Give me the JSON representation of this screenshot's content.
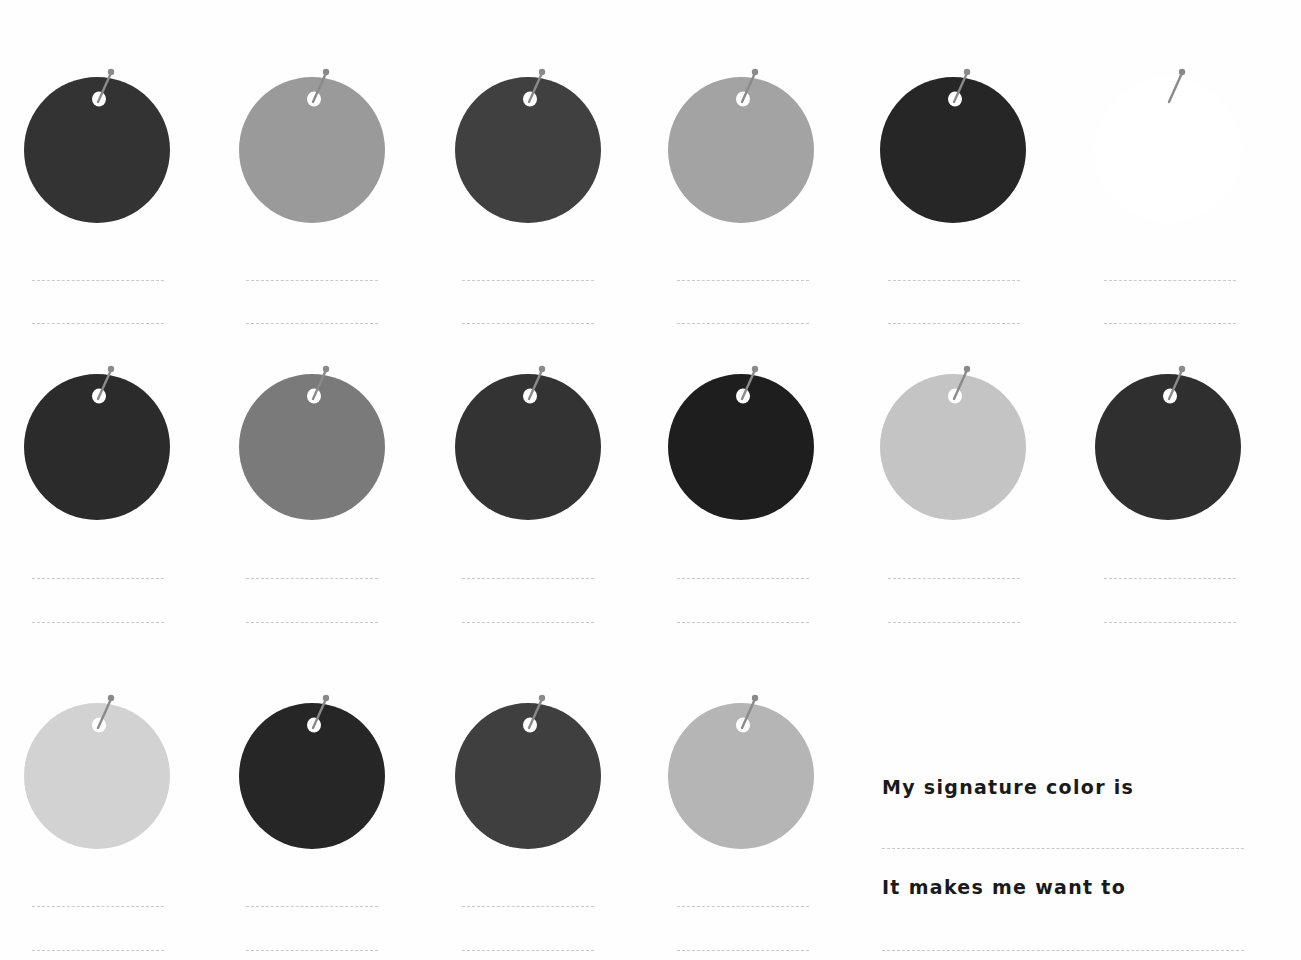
{
  "worksheet": {
    "tags": [
      {
        "row": 1,
        "col": 1,
        "cx": 97,
        "cy": 150,
        "color": "#333333"
      },
      {
        "row": 1,
        "col": 2,
        "cx": 312,
        "cy": 150,
        "color": "#9a9a9a"
      },
      {
        "row": 1,
        "col": 3,
        "cx": 528,
        "cy": 150,
        "color": "#404040"
      },
      {
        "row": 1,
        "col": 4,
        "cx": 741,
        "cy": 150,
        "color": "#a3a3a3"
      },
      {
        "row": 1,
        "col": 5,
        "cx": 953,
        "cy": 150,
        "color": "#262626"
      },
      {
        "row": 1,
        "col": 6,
        "cx": 1168,
        "cy": 150,
        "color": "#ffffff"
      },
      {
        "row": 2,
        "col": 1,
        "cx": 97,
        "cy": 447,
        "color": "#2b2b2b"
      },
      {
        "row": 2,
        "col": 2,
        "cx": 312,
        "cy": 447,
        "color": "#7a7a7a"
      },
      {
        "row": 2,
        "col": 3,
        "cx": 528,
        "cy": 447,
        "color": "#333333"
      },
      {
        "row": 2,
        "col": 4,
        "cx": 741,
        "cy": 447,
        "color": "#1e1e1e"
      },
      {
        "row": 2,
        "col": 5,
        "cx": 953,
        "cy": 447,
        "color": "#c4c4c4"
      },
      {
        "row": 2,
        "col": 6,
        "cx": 1168,
        "cy": 447,
        "color": "#2f2f2f"
      },
      {
        "row": 3,
        "col": 1,
        "cx": 97,
        "cy": 776,
        "color": "#d2d2d2"
      },
      {
        "row": 3,
        "col": 2,
        "cx": 312,
        "cy": 776,
        "color": "#262626"
      },
      {
        "row": 3,
        "col": 3,
        "cx": 528,
        "cy": 776,
        "color": "#3f3f3f"
      },
      {
        "row": 3,
        "col": 4,
        "cx": 741,
        "cy": 776,
        "color": "#b5b5b5"
      }
    ],
    "tag_radius": 73,
    "pin_color": "#8a8a8a",
    "hole_color": "#ffffff",
    "line_color": "#c9c9c9",
    "write_lines": [
      {
        "x": 32,
        "y": 280,
        "w": 132
      },
      {
        "x": 32,
        "y": 323,
        "w": 132
      },
      {
        "x": 246,
        "y": 280,
        "w": 132
      },
      {
        "x": 246,
        "y": 323,
        "w": 132
      },
      {
        "x": 462,
        "y": 280,
        "w": 132
      },
      {
        "x": 462,
        "y": 323,
        "w": 132
      },
      {
        "x": 677,
        "y": 280,
        "w": 132
      },
      {
        "x": 677,
        "y": 323,
        "w": 132
      },
      {
        "x": 888,
        "y": 280,
        "w": 132
      },
      {
        "x": 888,
        "y": 323,
        "w": 132
      },
      {
        "x": 1104,
        "y": 280,
        "w": 132
      },
      {
        "x": 1104,
        "y": 323,
        "w": 132
      },
      {
        "x": 32,
        "y": 578,
        "w": 132
      },
      {
        "x": 32,
        "y": 622,
        "w": 132
      },
      {
        "x": 246,
        "y": 578,
        "w": 132
      },
      {
        "x": 246,
        "y": 622,
        "w": 132
      },
      {
        "x": 462,
        "y": 578,
        "w": 132
      },
      {
        "x": 462,
        "y": 622,
        "w": 132
      },
      {
        "x": 677,
        "y": 578,
        "w": 132
      },
      {
        "x": 677,
        "y": 622,
        "w": 132
      },
      {
        "x": 888,
        "y": 578,
        "w": 132
      },
      {
        "x": 888,
        "y": 622,
        "w": 132
      },
      {
        "x": 1104,
        "y": 578,
        "w": 132
      },
      {
        "x": 1104,
        "y": 622,
        "w": 132
      },
      {
        "x": 32,
        "y": 906,
        "w": 132
      },
      {
        "x": 32,
        "y": 950,
        "w": 132
      },
      {
        "x": 246,
        "y": 906,
        "w": 132
      },
      {
        "x": 246,
        "y": 950,
        "w": 132
      },
      {
        "x": 462,
        "y": 906,
        "w": 132
      },
      {
        "x": 462,
        "y": 950,
        "w": 132
      },
      {
        "x": 677,
        "y": 906,
        "w": 132
      },
      {
        "x": 677,
        "y": 950,
        "w": 132
      }
    ]
  },
  "prompts": {
    "signature_color": "My signature color is",
    "makes_me_want": "It makes me want to"
  },
  "answer_lines": [
    {
      "x": 882,
      "y": 848,
      "w": 362
    },
    {
      "x": 882,
      "y": 950,
      "w": 362
    }
  ]
}
